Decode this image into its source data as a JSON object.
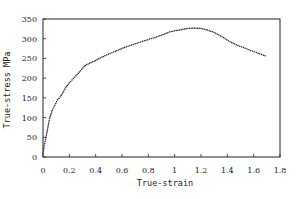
{
  "chart_data": {
    "type": "scatter",
    "title": "",
    "xlabel": "True-strain",
    "ylabel": "True-stress  MPa",
    "xlim": [
      0,
      1.8
    ],
    "ylim": [
      0,
      350
    ],
    "xticks": [
      "0",
      "0.2",
      "0.4",
      "0.6",
      "0.8",
      "1",
      "1.2",
      "1.4",
      "1.6",
      "1.8"
    ],
    "yticks": [
      "0",
      "50",
      "100",
      "150",
      "200",
      "250",
      "300",
      "350"
    ],
    "grid": false,
    "legend": null,
    "series": [
      {
        "name": "True stress-strain",
        "x": [
          0.0,
          0.01,
          0.02,
          0.04,
          0.05,
          0.07,
          0.09,
          0.11,
          0.13,
          0.15,
          0.17,
          0.2,
          0.25,
          0.32,
          0.4,
          0.47,
          0.55,
          0.62,
          0.7,
          0.77,
          0.85,
          0.9,
          0.96,
          1.0,
          1.05,
          1.1,
          1.15,
          1.2,
          1.25,
          1.3,
          1.36,
          1.42,
          1.48,
          1.55,
          1.62,
          1.7
        ],
        "y": [
          10,
          30,
          45,
          80,
          98,
          118,
          131,
          145,
          152,
          163,
          175,
          188,
          206,
          232,
          245,
          257,
          268,
          278,
          287,
          295,
          303,
          309,
          317,
          320,
          323,
          326,
          327,
          326,
          322,
          316,
          305,
          292,
          283,
          274,
          265,
          255
        ]
      }
    ]
  }
}
